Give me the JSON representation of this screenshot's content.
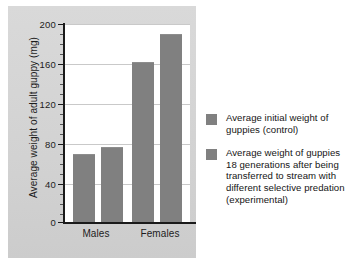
{
  "chart_data": {
    "type": "bar",
    "title": "",
    "xlabel": "",
    "ylabel": "Average weight of adult guppy (mg)",
    "ylim": [
      0,
      200
    ],
    "ytick_values": [
      0,
      40,
      80,
      120,
      160,
      200
    ],
    "ytick_labels": [
      "0",
      "40",
      "80",
      "120",
      "160",
      "200"
    ],
    "grid": true,
    "legend_position": "right",
    "categories": [
      "Males",
      "Females"
    ],
    "series": [
      {
        "name": "Average initial weight of guppies (control)",
        "color": "#808080",
        "values": [
          69,
          162
        ]
      },
      {
        "name": "Average weight of guppies 18 generations after being transferred to stream with different selective predation (experimental)",
        "color": "#808080",
        "values": [
          76,
          190
        ]
      }
    ],
    "bars": [
      {
        "category": "Males",
        "series": "control",
        "value": 69
      },
      {
        "category": "Males",
        "series": "experimental",
        "value": 76
      },
      {
        "category": "Females",
        "series": "control",
        "value": 162
      },
      {
        "category": "Females",
        "series": "experimental",
        "value": 190
      }
    ]
  },
  "axis": {
    "y_title": "Average weight of adult guppy (mg)",
    "ticks": [
      {
        "label": "200",
        "value": 200
      },
      {
        "label": "160",
        "value": 160
      },
      {
        "label": "120",
        "value": 120
      },
      {
        "label": "80",
        "value": 80
      },
      {
        "label": "40",
        "value": 40
      },
      {
        "label": "0",
        "value": 0
      }
    ],
    "categories": [
      {
        "label": "Males"
      },
      {
        "label": "Females"
      }
    ]
  },
  "legend": {
    "entries": [
      {
        "label": "Average initial weight of guppies (control)",
        "color": "#808080"
      },
      {
        "label": "Average weight of guppies 18 generations after being transferred to stream with different selective predation (experimental)",
        "color": "#808080"
      }
    ]
  },
  "colors": {
    "bar": "#808080",
    "panel_background": "#d4d4d4",
    "plot_background": "#ffffff",
    "gridline": "#c9c9c9",
    "axis": "#1a1a1a",
    "text": "#1c1c1c"
  }
}
